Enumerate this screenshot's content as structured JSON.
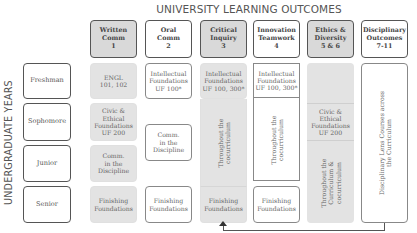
{
  "title": "UNIVERSITY LEARNING OUTCOMES",
  "side_label": "UNDERGRADUATE YEARS",
  "headers": [
    {
      "line1": "Written",
      "line2": "Comm",
      "line3": "1"
    },
    {
      "line1": "Oral",
      "line2": "Comm",
      "line3": "2"
    },
    {
      "line1": "Critical",
      "line2": "Inquiry",
      "line3": "3"
    },
    {
      "line1": "Innovation",
      "line2": "Teamwork",
      "line3": "4"
    },
    {
      "line1": "Ethics &",
      "line2": "Diversity",
      "line3": "5 & 6"
    },
    {
      "line1": "Disciplinary",
      "line2": "Outcomes",
      "line3": "7-11"
    }
  ],
  "years": [
    "Freshman",
    "Sophomore",
    "Junior",
    "Senior"
  ],
  "cells": {
    "written_freshman": {
      "line1": "ENGL",
      "line2": "101, 102"
    },
    "written_sophomore": {
      "line1": "Civic &",
      "line2": "Ethical",
      "line3": "Foundations",
      "line4": "UF 200"
    },
    "written_junior": {
      "line1": "Comm.",
      "line2": "in the",
      "line3": "Discipline"
    },
    "written_senior": {
      "line1": "Finishing",
      "line2": "Foundations"
    },
    "oral_freshman": {
      "line1": "Intellectual",
      "line2": "Foundations",
      "line3": "UF 100*"
    },
    "oral_mid": {
      "line1": "Comm.",
      "line2": "in the",
      "line3": "Discipline"
    },
    "oral_senior": {
      "line1": "Finishing",
      "line2": "Foundations"
    },
    "critical_freshman": {
      "line1": "Intellectual",
      "line2": "Foundations",
      "line3": "UF 100, 300*"
    },
    "critical_mid": {
      "line1": "Throughout the",
      "line2": "cocurriculum"
    },
    "critical_senior": {
      "line1": "Finishing",
      "line2": "Foundations"
    },
    "innovation_freshman": {
      "line1": "Intellectual",
      "line2": "Foundations",
      "line3": "UF 100, 300*"
    },
    "innovation_mid": {
      "line1": "Throughout the",
      "line2": "cocurriculum"
    },
    "innovation_senior": {
      "line1": "Finishing",
      "line2": "Foundations"
    },
    "ethics_sophomore": {
      "line1": "Civic &",
      "line2": "Ethical",
      "line3": "Foundations",
      "line4": "UF 200"
    },
    "ethics_lower": {
      "line1": "Throughout the",
      "line2": "Curriculum &",
      "line3": "cocurriculum"
    },
    "disciplinary": {
      "line1": "Disciplinary Lens Courses across",
      "line2": "the Curriculum"
    }
  },
  "colors": {
    "grey_fill": "#e3e3e3",
    "header_grey": "#d9d9d9",
    "border": "#555555",
    "text": "#555555"
  }
}
